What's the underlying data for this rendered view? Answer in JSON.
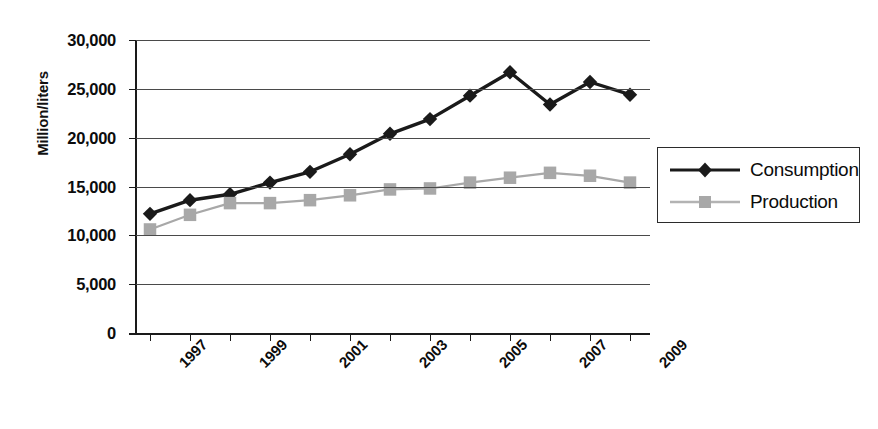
{
  "chart_data": {
    "type": "line",
    "title": "",
    "xlabel": "",
    "ylabel": "Million/liters",
    "ylim": [
      0,
      30000
    ],
    "ytick_labels": [
      "30,000",
      "25,000",
      "20,000",
      "15,000",
      "10,000",
      "5,000",
      "0"
    ],
    "ytick_values": [
      30000,
      25000,
      20000,
      15000,
      10000,
      5000,
      0
    ],
    "grid": true,
    "legend_position": "right",
    "x": [
      1997,
      1998,
      1999,
      2000,
      2001,
      2002,
      2003,
      2004,
      2005,
      2006,
      2007,
      2008,
      2009
    ],
    "xtick_labels": [
      "1997",
      "1999",
      "2001",
      "2003",
      "2005",
      "2007",
      "2009"
    ],
    "xtick_values": [
      1997,
      1999,
      2001,
      2003,
      2005,
      2007,
      2009
    ],
    "series": [
      {
        "name": "Consumption",
        "color": "#1a1a1a",
        "marker": "diamond",
        "values": [
          12200,
          13600,
          14200,
          15400,
          16500,
          18300,
          20400,
          21900,
          24300,
          26700,
          23400,
          25700,
          24400
        ]
      },
      {
        "name": "Production",
        "color": "#a8a8a8",
        "marker": "square",
        "values": [
          10600,
          12100,
          13300,
          13300,
          13600,
          14100,
          14700,
          14800,
          15400,
          15900,
          16400,
          16100,
          15400
        ]
      }
    ]
  },
  "legend": {
    "items": [
      {
        "label": "Consumption"
      },
      {
        "label": "Production"
      }
    ]
  }
}
